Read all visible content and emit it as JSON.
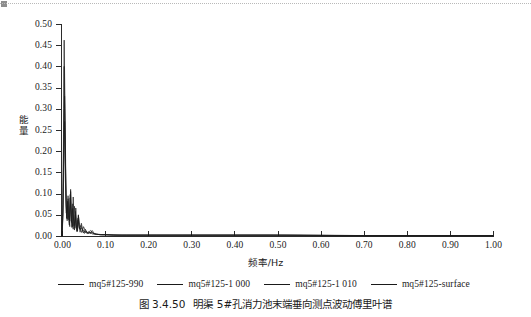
{
  "figure": {
    "caption_number": "图 3.4.50",
    "caption_text": "明渠 5#孔消力池末端垂向测点波动傅里叶谱"
  },
  "decoration": {
    "top_marker_name": "page-corner-marker"
  },
  "chart_data": {
    "type": "line",
    "title": "",
    "xlabel": "频率/Hz",
    "ylabel": "能量",
    "xlim": [
      0.0,
      1.0
    ],
    "ylim": [
      0.0,
      0.5
    ],
    "xticks": [
      "0.00",
      "0.10",
      "0.20",
      "0.30",
      "0.40",
      "0.50",
      "0.60",
      "0.70",
      "0.80",
      "0.90",
      "1.00"
    ],
    "xtick_values": [
      0.0,
      0.1,
      0.2,
      0.3,
      0.4,
      0.5,
      0.6,
      0.7,
      0.8,
      0.9,
      1.0
    ],
    "yticks": [
      "0.00",
      "0.05",
      "0.10",
      "0.15",
      "0.20",
      "0.25",
      "0.30",
      "0.35",
      "0.40",
      "0.45",
      "0.50"
    ],
    "ytick_values": [
      0.0,
      0.05,
      0.1,
      0.15,
      0.2,
      0.25,
      0.3,
      0.35,
      0.4,
      0.45,
      0.5
    ],
    "grid": false,
    "legend_position": "below",
    "line_color": "#1a1a1a",
    "series": [
      {
        "name": "mq5#125-990",
        "color": "#1a1a1a",
        "x": [
          0.0,
          0.002,
          0.004,
          0.005,
          0.007,
          0.009,
          0.01,
          0.012,
          0.014,
          0.016,
          0.018,
          0.02,
          0.022,
          0.024,
          0.026,
          0.028,
          0.03,
          0.032,
          0.034,
          0.036,
          0.038,
          0.04,
          0.042,
          0.045,
          0.048,
          0.051,
          0.054,
          0.058,
          0.062,
          0.066,
          0.07,
          0.075,
          0.08,
          0.09,
          0.1,
          0.12,
          0.15,
          0.2,
          0.3,
          0.4,
          0.5,
          0.6,
          0.7,
          0.8,
          0.9,
          1.0
        ],
        "y": [
          0.0,
          0.075,
          0.3,
          0.462,
          0.3,
          0.12,
          0.055,
          0.04,
          0.095,
          0.06,
          0.035,
          0.11,
          0.046,
          0.022,
          0.092,
          0.04,
          0.018,
          0.066,
          0.028,
          0.012,
          0.05,
          0.022,
          0.009,
          0.03,
          0.014,
          0.007,
          0.016,
          0.008,
          0.01,
          0.005,
          0.013,
          0.006,
          0.004,
          0.003,
          0.003,
          0.002,
          0.002,
          0.002,
          0.002,
          0.002,
          0.002,
          0.002,
          0.001,
          0.001,
          0.001,
          0.001
        ]
      },
      {
        "name": "mq5#125-1 000",
        "color": "#1a1a1a",
        "x": [
          0.0,
          0.002,
          0.004,
          0.005,
          0.007,
          0.009,
          0.011,
          0.013,
          0.015,
          0.017,
          0.019,
          0.021,
          0.023,
          0.025,
          0.027,
          0.029,
          0.031,
          0.033,
          0.035,
          0.037,
          0.04,
          0.044,
          0.048,
          0.052,
          0.056,
          0.06,
          0.065,
          0.07,
          0.08,
          0.09,
          0.1,
          0.13,
          0.17,
          0.25,
          0.35,
          0.45,
          0.55,
          0.65,
          0.75,
          0.85,
          0.95,
          1.0
        ],
        "y": [
          0.0,
          0.06,
          0.24,
          0.4,
          0.25,
          0.1,
          0.042,
          0.082,
          0.048,
          0.026,
          0.098,
          0.05,
          0.02,
          0.076,
          0.034,
          0.014,
          0.058,
          0.024,
          0.01,
          0.042,
          0.018,
          0.025,
          0.011,
          0.006,
          0.012,
          0.006,
          0.009,
          0.005,
          0.004,
          0.003,
          0.003,
          0.002,
          0.002,
          0.002,
          0.002,
          0.002,
          0.002,
          0.001,
          0.001,
          0.001,
          0.001,
          0.001
        ]
      },
      {
        "name": "mq5#125-1 010",
        "color": "#1a1a1a",
        "x": [
          0.0,
          0.002,
          0.004,
          0.006,
          0.008,
          0.01,
          0.012,
          0.014,
          0.016,
          0.018,
          0.02,
          0.023,
          0.026,
          0.029,
          0.032,
          0.035,
          0.038,
          0.042,
          0.046,
          0.05,
          0.055,
          0.06,
          0.066,
          0.072,
          0.08,
          0.09,
          0.1,
          0.12,
          0.16,
          0.22,
          0.32,
          0.42,
          0.52,
          0.62,
          0.72,
          0.82,
          0.92,
          1.0
        ],
        "y": [
          0.0,
          0.05,
          0.19,
          0.33,
          0.17,
          0.07,
          0.036,
          0.088,
          0.044,
          0.022,
          0.105,
          0.038,
          0.016,
          0.07,
          0.026,
          0.011,
          0.048,
          0.019,
          0.008,
          0.022,
          0.01,
          0.007,
          0.013,
          0.006,
          0.004,
          0.003,
          0.003,
          0.002,
          0.002,
          0.002,
          0.002,
          0.002,
          0.002,
          0.001,
          0.001,
          0.001,
          0.001,
          0.001
        ]
      },
      {
        "name": "mq5#125-surface",
        "color": "#1a1a1a",
        "x": [
          0.0,
          0.002,
          0.004,
          0.006,
          0.008,
          0.01,
          0.013,
          0.016,
          0.019,
          0.022,
          0.025,
          0.028,
          0.031,
          0.034,
          0.037,
          0.041,
          0.045,
          0.05,
          0.055,
          0.06,
          0.068,
          0.076,
          0.085,
          0.095,
          0.11,
          0.14,
          0.19,
          0.28,
          0.38,
          0.48,
          0.58,
          0.68,
          0.78,
          0.88,
          0.98,
          1.0
        ],
        "y": [
          0.0,
          0.04,
          0.15,
          0.27,
          0.13,
          0.055,
          0.072,
          0.038,
          0.09,
          0.032,
          0.065,
          0.024,
          0.05,
          0.02,
          0.038,
          0.016,
          0.018,
          0.013,
          0.008,
          0.006,
          0.009,
          0.005,
          0.004,
          0.003,
          0.003,
          0.002,
          0.002,
          0.002,
          0.002,
          0.002,
          0.001,
          0.001,
          0.001,
          0.001,
          0.001,
          0.001
        ]
      }
    ]
  },
  "legend": {
    "items": [
      {
        "label": "mq5#125-990"
      },
      {
        "label": "mq5#125-1 000"
      },
      {
        "label": "mq5#125-1 010"
      },
      {
        "label": "mq5#125-surface"
      }
    ]
  }
}
